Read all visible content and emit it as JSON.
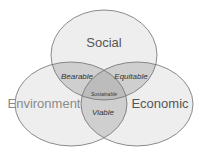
{
  "diagram": {
    "type": "venn",
    "sets": [
      {
        "id": "social",
        "label": "Social",
        "label_color": "#555555"
      },
      {
        "id": "environment",
        "label": "Environment",
        "label_color": "#8a8a8a"
      },
      {
        "id": "economic",
        "label": "Economic",
        "label_color": "#555555"
      }
    ],
    "overlaps": [
      {
        "sets": [
          "social",
          "environment"
        ],
        "label": "Bearable"
      },
      {
        "sets": [
          "social",
          "economic"
        ],
        "label": "Equitable"
      },
      {
        "sets": [
          "environment",
          "economic"
        ],
        "label": "Viable"
      },
      {
        "sets": [
          "social",
          "environment",
          "economic"
        ],
        "label": "Sustainable"
      }
    ],
    "colors": {
      "single_fill": "#eeeeee",
      "double_fill": "#cfcfcf",
      "triple_fill": "#bcbcbc",
      "stroke": "#6e6e6e",
      "overlap_text": "#333333"
    }
  }
}
